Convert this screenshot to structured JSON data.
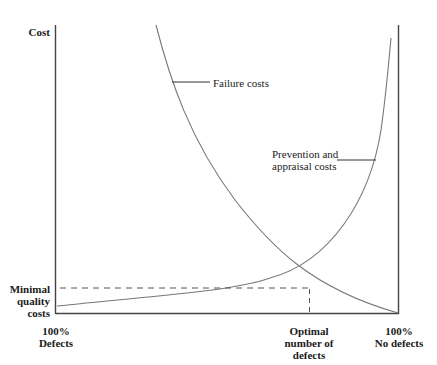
{
  "diagram": {
    "type": "cost-of-quality curve",
    "y_axis_label": "Cost",
    "y_marker_label": [
      "Minimal",
      "quality",
      "costs"
    ],
    "x_left_label": [
      "100%",
      "Defects"
    ],
    "x_mid_label": [
      "Optimal",
      "number of",
      "defects"
    ],
    "x_right_label": [
      "100%",
      "No defects"
    ],
    "curves": [
      {
        "name": "Failure costs",
        "label": [
          "Failure costs"
        ],
        "trend": "decreasing"
      },
      {
        "name": "Prevention and appraisal costs",
        "label": [
          "Prevention and",
          "appraisal costs"
        ],
        "trend": "increasing"
      }
    ],
    "colors": {
      "axis": "#555555",
      "curve": "#777777",
      "text": "#1a1a1a",
      "dash": "#555555"
    }
  }
}
